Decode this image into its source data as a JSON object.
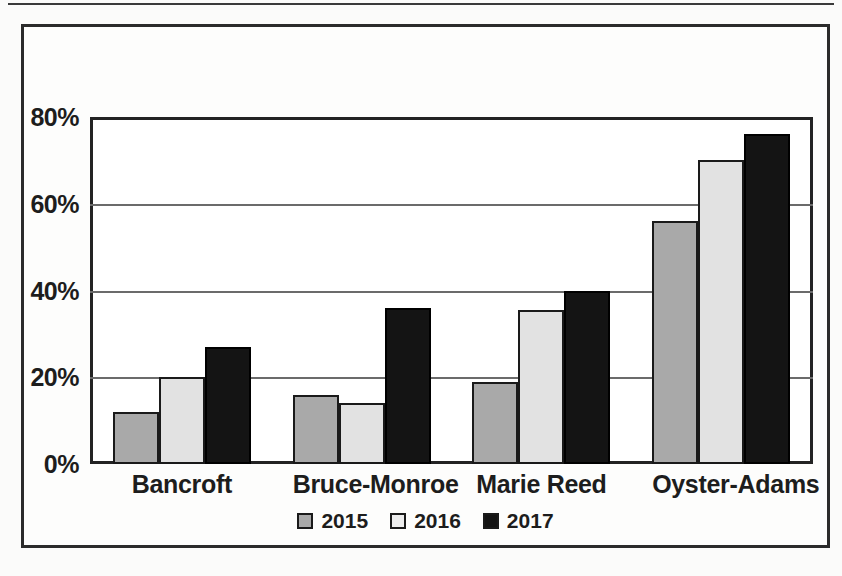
{
  "figure": {
    "background_color": "#fdfdfc",
    "frame_color": "#2b2b2b"
  },
  "legend": {
    "position": "bottom-center",
    "entries": [
      {
        "label": "2015",
        "color": "#a9a9a9",
        "swatch": "square-swatch-icon"
      },
      {
        "label": "2016",
        "color": "#e2e2e2",
        "swatch": "square-swatch-icon"
      },
      {
        "label": "2017",
        "color": "#141414",
        "swatch": "square-swatch-icon"
      }
    ]
  },
  "chart_data": {
    "type": "bar",
    "title": "",
    "xlabel": "",
    "ylabel": "",
    "categories": [
      "Bancroft",
      "Bruce-Monroe",
      "Marie Reed",
      "Oyster-Adams"
    ],
    "series": [
      {
        "name": "2015",
        "color": "#a9a9a9",
        "values": [
          12,
          16,
          19,
          56
        ]
      },
      {
        "name": "2016",
        "color": "#e2e2e2",
        "values": [
          20,
          14,
          35.5,
          70
        ]
      },
      {
        "name": "2017",
        "color": "#141414",
        "values": [
          27,
          36,
          40,
          76
        ]
      }
    ],
    "ylim": [
      0,
      80
    ],
    "ytick_values": [
      0,
      20,
      40,
      60,
      80
    ],
    "ytick_labels": [
      "0%",
      "20%",
      "40%",
      "60%",
      "80%"
    ],
    "grid": true,
    "grid_axis": "y",
    "legend_position": "bottom-center"
  }
}
